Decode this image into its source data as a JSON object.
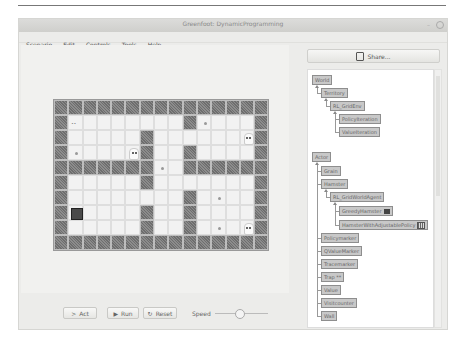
{
  "window": {
    "title": "Greenfoot: DynamicProgramming"
  },
  "menu": [
    "Scenario",
    "Edit",
    "Controls",
    "Tools",
    "Help"
  ],
  "share": {
    "label": "Share...",
    "icon": "share-icon"
  },
  "world_tree": {
    "root": "World",
    "nodes": [
      {
        "label": "World",
        "depth": 0
      },
      {
        "label": "Territory",
        "depth": 1
      },
      {
        "label": "RL_GridEnv",
        "depth": 2
      },
      {
        "label": "PolicyIteration",
        "depth": 3
      },
      {
        "label": "ValueIteration",
        "depth": 3
      }
    ]
  },
  "actor_tree": {
    "root": "Actor",
    "nodes": [
      {
        "label": "Actor",
        "depth": 0
      },
      {
        "label": "Grain",
        "depth": 1
      },
      {
        "label": "Hamster",
        "depth": 1
      },
      {
        "label": "RL_GridWorldAgent",
        "depth": 2
      },
      {
        "label": "GreedyHamster",
        "depth": 3,
        "icon": "hamster-icon"
      },
      {
        "label": "HamsterWithAdjustablePolicy",
        "depth": 3,
        "icon": "grid-icon"
      },
      {
        "label": "Policymarker",
        "depth": 1
      },
      {
        "label": "QValueMarker",
        "depth": 1
      },
      {
        "label": "Tracemarker",
        "depth": 1
      },
      {
        "label": "Trap",
        "depth": 1,
        "suffix": "**"
      },
      {
        "label": "Value",
        "depth": 1
      },
      {
        "label": "Visitcounter",
        "depth": 1
      },
      {
        "label": "Wall",
        "depth": 1
      }
    ]
  },
  "controls": {
    "act": "Act",
    "run": "Run",
    "reset": "Reset",
    "speed_label": "Speed",
    "speed_value_pct": 45
  },
  "grid": {
    "cols": 15,
    "rows": 10,
    "walls": [
      [
        0,
        0
      ],
      [
        0,
        1
      ],
      [
        0,
        2
      ],
      [
        0,
        3
      ],
      [
        0,
        4
      ],
      [
        0,
        5
      ],
      [
        0,
        6
      ],
      [
        0,
        7
      ],
      [
        0,
        8
      ],
      [
        0,
        9
      ],
      [
        0,
        10
      ],
      [
        0,
        11
      ],
      [
        0,
        12
      ],
      [
        0,
        13
      ],
      [
        0,
        14
      ],
      [
        1,
        0
      ],
      [
        1,
        9
      ],
      [
        1,
        14
      ],
      [
        2,
        0
      ],
      [
        2,
        6
      ],
      [
        2,
        14
      ],
      [
        3,
        0
      ],
      [
        3,
        6
      ],
      [
        3,
        9
      ],
      [
        3,
        14
      ],
      [
        4,
        0
      ],
      [
        4,
        1
      ],
      [
        4,
        2
      ],
      [
        4,
        3
      ],
      [
        4,
        4
      ],
      [
        4,
        5
      ],
      [
        4,
        6
      ],
      [
        4,
        9
      ],
      [
        4,
        10
      ],
      [
        4,
        11
      ],
      [
        4,
        12
      ],
      [
        4,
        13
      ],
      [
        4,
        14
      ],
      [
        5,
        0
      ],
      [
        5,
        6
      ],
      [
        5,
        14
      ],
      [
        6,
        0
      ],
      [
        6,
        9
      ],
      [
        6,
        14
      ],
      [
        7,
        0
      ],
      [
        7,
        6
      ],
      [
        7,
        9
      ],
      [
        7,
        14
      ],
      [
        8,
        0
      ],
      [
        8,
        6
      ],
      [
        8,
        9
      ],
      [
        8,
        14
      ],
      [
        9,
        0
      ],
      [
        9,
        1
      ],
      [
        9,
        2
      ],
      [
        9,
        3
      ],
      [
        9,
        4
      ],
      [
        9,
        5
      ],
      [
        9,
        6
      ],
      [
        9,
        7
      ],
      [
        9,
        8
      ],
      [
        9,
        9
      ],
      [
        9,
        10
      ],
      [
        9,
        11
      ],
      [
        9,
        12
      ],
      [
        9,
        13
      ],
      [
        9,
        14
      ]
    ],
    "ghosts": [
      [
        2,
        13
      ],
      [
        3,
        5
      ],
      [
        8,
        13
      ]
    ],
    "hamster": [
      7,
      1
    ],
    "dots": [
      [
        1,
        10
      ],
      [
        3,
        1
      ],
      [
        4,
        7
      ],
      [
        6,
        11
      ],
      [
        8,
        11
      ]
    ],
    "trap_marks": [
      [
        1,
        1
      ]
    ]
  }
}
